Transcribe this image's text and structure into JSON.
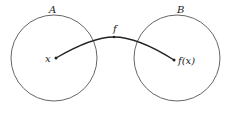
{
  "diagram": {
    "sets": [
      {
        "label": "A",
        "cx": 54,
        "cy": 58,
        "r": 43
      },
      {
        "label": "B",
        "cx": 177,
        "cy": 58,
        "r": 43
      }
    ],
    "points": [
      {
        "label": "x",
        "x": 56,
        "y": 58
      },
      {
        "label": "f(x)",
        "x": 174,
        "y": 60
      }
    ],
    "arrow": {
      "label": "f"
    },
    "colors": {
      "stroke": "#555555",
      "curve": "#222222",
      "text": "#222222"
    }
  }
}
